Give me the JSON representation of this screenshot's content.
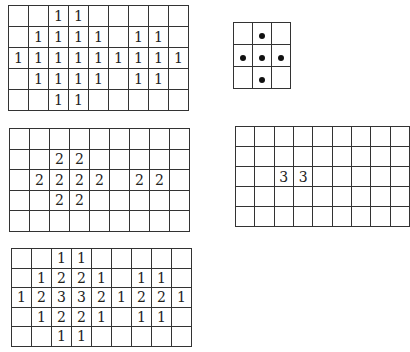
{
  "figure": {
    "grids": {
      "input": {
        "rows": 5,
        "cols": 9,
        "cells": [
          [
            "",
            "",
            "1",
            "1",
            "",
            "",
            "",
            "",
            ""
          ],
          [
            "",
            "1",
            "1",
            "1",
            "1",
            "",
            "1",
            "1",
            ""
          ],
          [
            "1",
            "1",
            "1",
            "1",
            "1",
            "1",
            "1",
            "1",
            "1"
          ],
          [
            "",
            "1",
            "1",
            "1",
            "1",
            "",
            "1",
            "1",
            ""
          ],
          [
            "",
            "",
            "1",
            "1",
            "",
            "",
            "",
            "",
            ""
          ]
        ]
      },
      "kernel": {
        "rows": 3,
        "cols": 3,
        "cells": [
          [
            "",
            "dot",
            ""
          ],
          [
            "dot",
            "dot",
            "dot"
          ],
          [
            "",
            "dot",
            ""
          ]
        ]
      },
      "level2": {
        "rows": 5,
        "cols": 9,
        "cells": [
          [
            "",
            "",
            "",
            "",
            "",
            "",
            "",
            "",
            ""
          ],
          [
            "",
            "",
            "2",
            "2",
            "",
            "",
            "",
            "",
            ""
          ],
          [
            "",
            "2",
            "2",
            "2",
            "2",
            "",
            "2",
            "2",
            ""
          ],
          [
            "",
            "",
            "2",
            "2",
            "",
            "",
            "",
            "",
            ""
          ],
          [
            "",
            "",
            "",
            "",
            "",
            "",
            "",
            "",
            ""
          ]
        ]
      },
      "level3": {
        "rows": 5,
        "cols": 9,
        "cells": [
          [
            "",
            "",
            "",
            "",
            "",
            "",
            "",
            "",
            ""
          ],
          [
            "",
            "",
            "",
            "",
            "",
            "",
            "",
            "",
            ""
          ],
          [
            "",
            "",
            "3",
            "3",
            "",
            "",
            "",
            "",
            ""
          ],
          [
            "",
            "",
            "",
            "",
            "",
            "",
            "",
            "",
            ""
          ],
          [
            "",
            "",
            "",
            "",
            "",
            "",
            "",
            "",
            ""
          ]
        ]
      },
      "sum": {
        "rows": 5,
        "cols": 9,
        "cells": [
          [
            "",
            "",
            "1",
            "1",
            "",
            "",
            "",
            "",
            ""
          ],
          [
            "",
            "1",
            "2",
            "2",
            "1",
            "",
            "1",
            "1",
            ""
          ],
          [
            "1",
            "2",
            "3",
            "3",
            "2",
            "1",
            "2",
            "2",
            "1"
          ],
          [
            "",
            "1",
            "2",
            "2",
            "1",
            "",
            "1",
            "1",
            ""
          ],
          [
            "",
            "",
            "1",
            "1",
            "",
            "",
            "",
            "",
            ""
          ]
        ]
      }
    },
    "colors": {
      "line": "#333333",
      "text": "#222222",
      "dot": "#111111",
      "background": "#ffffff"
    }
  }
}
